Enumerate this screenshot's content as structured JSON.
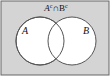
{
  "diagram": {
    "type": "venn",
    "title": {
      "set_a": "A",
      "sup_a": "c",
      "operator": "∩",
      "set_b": "B",
      "sup_b": "c"
    },
    "sets": [
      {
        "id": "a",
        "label": "A"
      },
      {
        "id": "b",
        "label": "B"
      }
    ],
    "shaded_region": "complement of A union B",
    "colors": {
      "shade": "#d4d4d4",
      "circle_fill": "#ffffff",
      "stroke": "#555555"
    }
  }
}
